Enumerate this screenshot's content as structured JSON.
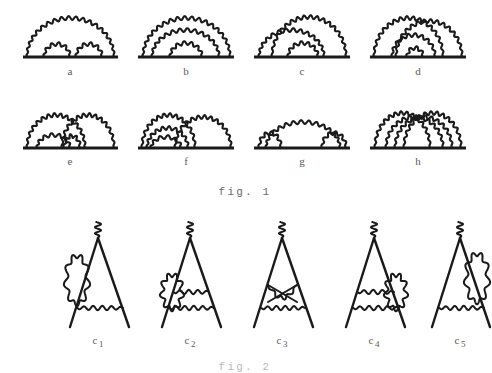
{
  "document": {
    "kind": "feynman-diagram-figure",
    "background_color": "#ffffff",
    "ink_color": "#1a1a1a",
    "label_color": "#5a5a5a"
  },
  "figure1": {
    "caption": "fig. 1",
    "caption_x": 245,
    "caption_y": 186,
    "rows": [
      {
        "baseline_y": 57,
        "label_y": 65,
        "diagrams": [
          {
            "id": "a",
            "label": "a",
            "center_x": 70,
            "line_x1": 23,
            "line_x2": 118,
            "label_x": 70,
            "arcs": [
              {
                "x1": 27,
                "x2": 114,
                "height": 39,
                "kind": "photon"
              },
              {
                "x1": 44,
                "x2": 70,
                "height": 13,
                "kind": "photon"
              },
              {
                "x1": 76,
                "x2": 102,
                "height": 13,
                "kind": "photon"
              }
            ]
          },
          {
            "id": "b",
            "label": "b",
            "center_x": 186,
            "line_x1": 138,
            "line_x2": 234,
            "label_x": 186,
            "arcs": [
              {
                "x1": 143,
                "x2": 230,
                "height": 39,
                "kind": "photon"
              },
              {
                "x1": 152,
                "x2": 219,
                "height": 27,
                "kind": "photon"
              },
              {
                "x1": 170,
                "x2": 202,
                "height": 14,
                "kind": "photon"
              }
            ]
          },
          {
            "id": "c",
            "label": "c",
            "center_x": 302,
            "line_x1": 254,
            "line_x2": 350,
            "label_x": 302,
            "arcs": [
              {
                "x1": 272,
                "x2": 346,
                "height": 40,
                "kind": "photon"
              },
              {
                "x1": 259,
                "x2": 324,
                "height": 27,
                "kind": "photon"
              },
              {
                "x1": 288,
                "x2": 318,
                "height": 14,
                "kind": "photon"
              }
            ]
          },
          {
            "id": "d",
            "label": "d",
            "center_x": 418,
            "line_x1": 370,
            "line_x2": 466,
            "label_x": 418,
            "arcs": [
              {
                "x1": 374,
                "x2": 443,
                "height": 39,
                "kind": "photon"
              },
              {
                "x1": 396,
                "x2": 462,
                "height": 36,
                "kind": "photon"
              },
              {
                "x1": 392,
                "x2": 435,
                "height": 22,
                "kind": "photon"
              },
              {
                "x1": 407,
                "x2": 423,
                "height": 9,
                "kind": "photon"
              }
            ]
          }
        ]
      },
      {
        "baseline_y": 148,
        "label_y": 155,
        "diagrams": [
          {
            "id": "e",
            "label": "e",
            "center_x": 70,
            "line_x1": 23,
            "line_x2": 118,
            "label_x": 70,
            "arcs": [
              {
                "x1": 27,
                "x2": 85,
                "height": 33,
                "kind": "photon"
              },
              {
                "x1": 62,
                "x2": 114,
                "height": 33,
                "kind": "photon"
              },
              {
                "x1": 37,
                "x2": 70,
                "height": 13,
                "kind": "photon"
              },
              {
                "x1": 64,
                "x2": 80,
                "height": 12,
                "kind": "photon"
              }
            ]
          },
          {
            "id": "f",
            "label": "f",
            "center_x": 186,
            "line_x1": 138,
            "line_x2": 234,
            "label_x": 186,
            "arcs": [
              {
                "x1": 142,
                "x2": 195,
                "height": 33,
                "kind": "photon"
              },
              {
                "x1": 175,
                "x2": 231,
                "height": 31,
                "kind": "photon"
              },
              {
                "x1": 147,
                "x2": 188,
                "height": 20,
                "kind": "photon"
              },
              {
                "x1": 151,
                "x2": 181,
                "height": 11,
                "kind": "photon"
              }
            ]
          },
          {
            "id": "g",
            "label": "g",
            "center_x": 302,
            "line_x1": 254,
            "line_x2": 350,
            "label_x": 302,
            "arcs": [
              {
                "x1": 266,
                "x2": 340,
                "height": 26,
                "kind": "photon"
              },
              {
                "x1": 259,
                "x2": 281,
                "height": 15,
                "kind": "photon"
              },
              {
                "x1": 322,
                "x2": 346,
                "height": 15,
                "kind": "photon"
              }
            ]
          },
          {
            "id": "h",
            "label": "h",
            "center_x": 418,
            "line_x1": 370,
            "line_x2": 466,
            "label_x": 418,
            "arcs": [
              {
                "x1": 375,
                "x2": 430,
                "height": 35,
                "kind": "photon"
              },
              {
                "x1": 404,
                "x2": 461,
                "height": 35,
                "kind": "photon"
              },
              {
                "x1": 386,
                "x2": 443,
                "height": 31,
                "kind": "photon"
              },
              {
                "x1": 395,
                "x2": 452,
                "height": 31,
                "kind": "photon"
              }
            ]
          }
        ]
      }
    ]
  },
  "figure2": {
    "caption": "fig. 2",
    "caption_x": 245,
    "caption_y": 361,
    "apex_y": 238,
    "base_y": 327,
    "label_y": 334,
    "vertices": [
      {
        "id": "c1",
        "label": "c",
        "subscript": "1",
        "apex_x": 98,
        "left_x": 70,
        "right_x": 129,
        "label_x": 98,
        "external_photon": {
          "from_y": 238,
          "wiggles": 3
        },
        "internal_lines": [
          {
            "kind": "photon-wavy",
            "y": 308,
            "x1": 77,
            "x2": 123
          }
        ],
        "self_energy_blob": {
          "side": "left",
          "cx": 77,
          "cy": 280,
          "rx": 11,
          "ry": 24
        }
      },
      {
        "id": "c2",
        "label": "c",
        "subscript": "2",
        "apex_x": 190,
        "left_x": 162,
        "right_x": 221,
        "label_x": 190,
        "external_photon": {
          "from_y": 238,
          "wiggles": 3
        },
        "internal_lines": [
          {
            "kind": "photon-wavy",
            "y": 292,
            "x1": 173,
            "x2": 209
          },
          {
            "kind": "photon-wavy",
            "y": 308,
            "x1": 169,
            "x2": 214
          }
        ],
        "self_energy_blob": {
          "side": "left",
          "cx": 172,
          "cy": 292,
          "rx": 10,
          "ry": 17
        }
      },
      {
        "id": "c3",
        "label": "c",
        "subscript": "3",
        "apex_x": 282,
        "left_x": 254,
        "right_x": 313,
        "label_x": 282,
        "external_photon": {
          "from_y": 238,
          "wiggles": 3
        },
        "internal_lines": [
          {
            "kind": "photon-bowtie",
            "y": 285,
            "x1": 268,
            "x2": 297,
            "dip": 13
          },
          {
            "kind": "photon-wavy",
            "y": 308,
            "x1": 261,
            "x2": 305
          }
        ],
        "self_energy_blob": null
      },
      {
        "id": "c4",
        "label": "c",
        "subscript": "4",
        "apex_x": 374,
        "left_x": 346,
        "right_x": 405,
        "label_x": 374,
        "external_photon": {
          "from_y": 238,
          "wiggles": 3
        },
        "internal_lines": [
          {
            "kind": "photon-wavy",
            "y": 292,
            "x1": 357,
            "x2": 394
          },
          {
            "kind": "photon-wavy",
            "y": 308,
            "x1": 353,
            "x2": 399
          }
        ],
        "self_energy_blob": {
          "side": "right",
          "cx": 396,
          "cy": 292,
          "rx": 10,
          "ry": 17
        }
      },
      {
        "id": "c5",
        "label": "c",
        "subscript": "5",
        "apex_x": 460,
        "left_x": 432,
        "right_x": 490,
        "label_x": 460,
        "external_photon": {
          "from_y": 238,
          "wiggles": 3
        },
        "internal_lines": [
          {
            "kind": "photon-wavy",
            "y": 308,
            "x1": 439,
            "x2": 484
          }
        ],
        "self_energy_blob": {
          "side": "right",
          "cx": 477,
          "cy": 278,
          "rx": 11,
          "ry": 24
        }
      }
    ]
  }
}
